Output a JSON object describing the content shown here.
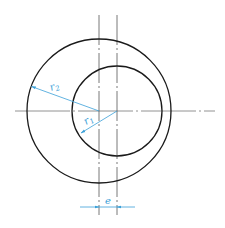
{
  "diagram": {
    "colors": {
      "outline": "#1a1a1a",
      "centerline": "#555555",
      "dimension": "#3aa0d8",
      "background": "#ffffff"
    },
    "outer_circle": {
      "cx": 99,
      "cy": 111,
      "r": 72
    },
    "inner_circle": {
      "cx": 117,
      "cy": 111,
      "r": 45
    },
    "labels": {
      "r2": "r",
      "r2_sub": "2",
      "r1": "r",
      "r1_sub": "1",
      "e": "e"
    }
  }
}
